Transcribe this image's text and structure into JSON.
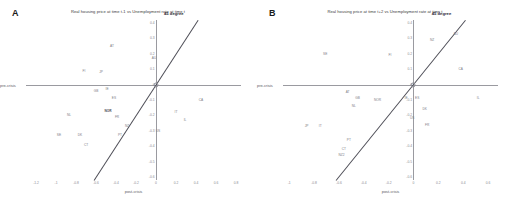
{
  "figure": {
    "panels": [
      {
        "letter": "A",
        "title": "Real housing price at time t-1 vs Unemployment rate at time t",
        "xlabel": "post-crisis",
        "ylabel": "pre-crisis",
        "line_label": "45 degree",
        "xticks": [
          "-1.2",
          "-1",
          "-0.8",
          "-0.6",
          "-0.4",
          "-0.2",
          "0",
          "0.2",
          "0.4",
          "0.6",
          "0.8"
        ],
        "yticks": [
          "0.4",
          "0.3",
          "0.2",
          "0.1",
          "0",
          "-0.1",
          "-0.2",
          "-0.3",
          "-0.4",
          "-0.5",
          "-0.6"
        ],
        "points": [
          {
            "label": "AT",
            "x": -0.44,
            "y": 0.25
          },
          {
            "label": "AU",
            "x": -0.02,
            "y": 0.17
          },
          {
            "label": "FI",
            "x": -0.72,
            "y": 0.09
          },
          {
            "label": "JP",
            "x": -0.55,
            "y": 0.08
          },
          {
            "label": "GB",
            "x": -0.6,
            "y": -0.04
          },
          {
            "label": "IE",
            "x": -0.49,
            "y": -0.03
          },
          {
            "label": "ES",
            "x": -0.42,
            "y": -0.09
          },
          {
            "label": "CA",
            "x": 0.45,
            "y": -0.1
          },
          {
            "label": "NOR",
            "x": -0.48,
            "y": -0.17,
            "bold": true
          },
          {
            "label": "FR",
            "x": -0.39,
            "y": -0.21
          },
          {
            "label": "NL",
            "x": -0.87,
            "y": -0.2
          },
          {
            "label": "IT",
            "x": 0.2,
            "y": -0.18
          },
          {
            "label": "IL",
            "x": 0.29,
            "y": -0.23
          },
          {
            "label": "NZ",
            "x": -0.29,
            "y": -0.27
          },
          {
            "label": "US",
            "x": 0.02,
            "y": -0.3
          },
          {
            "label": "SE",
            "x": -0.97,
            "y": -0.33
          },
          {
            "label": "PT",
            "x": -0.36,
            "y": -0.33
          },
          {
            "label": "DK",
            "x": -0.76,
            "y": -0.33
          },
          {
            "label": "CT",
            "x": -0.7,
            "y": -0.39
          }
        ]
      },
      {
        "letter": "B",
        "title": "Real housing price at time t+2 vs Unemployment rate at time t",
        "xlabel": "post-crisis",
        "ylabel": "pre-crisis",
        "line_label": "45 degree",
        "xticks": [
          "-1",
          "-0.8",
          "-0.6",
          "-0.4",
          "-0.2",
          "0",
          "0.2",
          "0.4",
          "0.6"
        ],
        "yticks": [
          "0.4",
          "0.3",
          "0.2",
          "0.1",
          "0",
          "-0.1",
          "-0.2",
          "-0.3",
          "-0.4",
          "-0.5",
          "-0.6"
        ],
        "points": [
          {
            "label": "AU",
            "x": 0.34,
            "y": 0.33
          },
          {
            "label": "NZ",
            "x": 0.15,
            "y": 0.29
          },
          {
            "label": "SE",
            "x": -0.71,
            "y": 0.2
          },
          {
            "label": "FI",
            "x": -0.19,
            "y": 0.19
          },
          {
            "label": "CA",
            "x": 0.38,
            "y": 0.1
          },
          {
            "label": "AT",
            "x": -0.53,
            "y": -0.05
          },
          {
            "label": "GB",
            "x": -0.45,
            "y": -0.09
          },
          {
            "label": "NOR",
            "x": -0.29,
            "y": -0.1
          },
          {
            "label": "IL",
            "x": 0.52,
            "y": -0.09
          },
          {
            "label": "IE",
            "x": -0.06,
            "y": -0.09
          },
          {
            "label": "ES",
            "x": 0.03,
            "y": -0.09
          },
          {
            "label": "NL",
            "x": -0.48,
            "y": -0.14
          },
          {
            "label": "DK",
            "x": 0.09,
            "y": -0.16
          },
          {
            "label": "US",
            "x": -0.01,
            "y": -0.22
          },
          {
            "label": "FR",
            "x": 0.11,
            "y": -0.26
          },
          {
            "label": "IT",
            "x": -0.75,
            "y": -0.27
          },
          {
            "label": "JP",
            "x": -0.86,
            "y": -0.27
          },
          {
            "label": "PT",
            "x": -0.52,
            "y": -0.36
          },
          {
            "label": "CT",
            "x": -0.56,
            "y": -0.42
          },
          {
            "label": "NZ2",
            "x": -0.58,
            "y": -0.46
          }
        ]
      }
    ]
  }
}
